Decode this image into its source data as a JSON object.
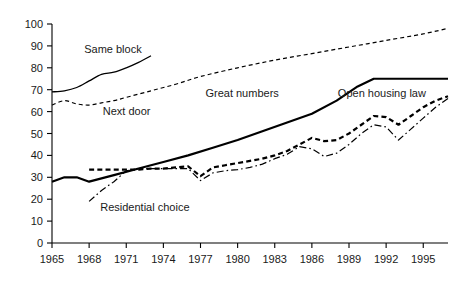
{
  "chart_data": {
    "type": "line",
    "title": "",
    "subtitle": "",
    "xlabel": "",
    "ylabel": "",
    "xlim": [
      1965,
      1997
    ],
    "ylim": [
      0,
      100
    ],
    "grid": false,
    "legend_position": "inline-annotations",
    "x_ticks": [
      "1965",
      "1968",
      "1971",
      "1974",
      "1977",
      "1980",
      "1983",
      "1986",
      "1989",
      "1992",
      "1995"
    ],
    "x_tick_values": [
      1965,
      1968,
      1971,
      1974,
      1977,
      1980,
      1983,
      1986,
      1989,
      1992,
      1995
    ],
    "y_ticks": [
      "0",
      "10",
      "20",
      "30",
      "40",
      "50",
      "60",
      "70",
      "80",
      "90",
      "100"
    ],
    "y_tick_values": [
      0,
      10,
      20,
      30,
      40,
      50,
      60,
      70,
      80,
      90,
      100
    ],
    "series": [
      {
        "name": "Same block",
        "label": "Same block",
        "style": "solid-thin",
        "color": "#000000",
        "label_x": 1967.6,
        "label_y": 88.5,
        "x": [
          1965,
          1966,
          1967,
          1968,
          1969,
          1970,
          1971,
          1972,
          1973
        ],
        "values": [
          69,
          69.5,
          71,
          74,
          77,
          78,
          80,
          82.5,
          85.5
        ]
      },
      {
        "name": "Next door",
        "label": "Next door",
        "style": "dash-thin",
        "color": "#000000",
        "label_x": 1969.1,
        "label_y": 60.5,
        "x": [
          1965,
          1966,
          1967,
          1968,
          1969,
          1970,
          1971,
          1973,
          1975,
          1977,
          1980,
          1983,
          1986,
          1989,
          1992,
          1995,
          1997
        ],
        "values": [
          63,
          65,
          63.5,
          63,
          64,
          65,
          66.5,
          69.5,
          72.5,
          76,
          80,
          83.5,
          86.5,
          89.5,
          92.5,
          95.5,
          98
        ]
      },
      {
        "name": "Great numbers",
        "label": "Great numbers",
        "style": "solid-thick",
        "color": "#000000",
        "label_x": 1977.4,
        "label_y": 68.5,
        "x": [
          1965,
          1966,
          1967,
          1968,
          1970,
          1972,
          1974,
          1976,
          1978,
          1980,
          1982,
          1984,
          1986,
          1988,
          1989.7,
          1991,
          1994,
          1997
        ],
        "values": [
          28,
          30,
          30,
          28,
          31,
          34,
          37,
          40,
          43.5,
          47,
          51,
          55,
          59,
          65,
          71.5,
          75,
          75,
          75
        ]
      },
      {
        "name": "Open housing law",
        "label": "Open housing law",
        "style": "dash-thick",
        "color": "#000000",
        "label_x": 1988.1,
        "label_y": 68.5,
        "x": [
          1968,
          1969,
          1970,
          1971,
          1972,
          1973,
          1974,
          1975,
          1976,
          1977,
          1978,
          1979,
          1980,
          1981,
          1982,
          1983,
          1984,
          1985,
          1986,
          1987,
          1988,
          1989,
          1990,
          1991,
          1992,
          1993,
          1994,
          1995,
          1996,
          1997
        ],
        "values": [
          33.5,
          33.5,
          33.5,
          33.5,
          33.5,
          34,
          34,
          34.5,
          35,
          30.5,
          34.5,
          35.5,
          36.5,
          37.5,
          38.5,
          40,
          42,
          45,
          48,
          46.5,
          47,
          50,
          54,
          58,
          57.5,
          54,
          58,
          62,
          65,
          67
        ]
      },
      {
        "name": "Residential choice",
        "label": "Residential choice",
        "style": "dashdot",
        "color": "#000000",
        "label_x": 1968.9,
        "label_y": 16.5,
        "x": [
          1968,
          1969,
          1970,
          1971,
          1972,
          1973,
          1974,
          1975,
          1976,
          1977,
          1978,
          1979,
          1980,
          1981,
          1982,
          1983,
          1984,
          1985,
          1986,
          1987,
          1988,
          1989,
          1990,
          1991,
          1992,
          1993,
          1994,
          1995,
          1996,
          1997
        ],
        "values": [
          19,
          24,
          28,
          33,
          34,
          34,
          34,
          34,
          34,
          28.5,
          32,
          33,
          33.5,
          34.5,
          36,
          38.5,
          40.5,
          44,
          43,
          39.5,
          41,
          45,
          50,
          54,
          53,
          47,
          52,
          57,
          62,
          66
        ]
      }
    ]
  }
}
